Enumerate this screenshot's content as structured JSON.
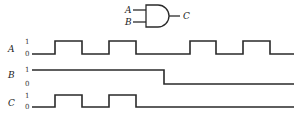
{
  "gate": {
    "type": "AND",
    "inputs": [
      "A",
      "B"
    ],
    "output": "C"
  },
  "signals": [
    {
      "name": "A",
      "high_label": "1",
      "low_label": "0",
      "levels": [
        0,
        1,
        0,
        1,
        0,
        0,
        1,
        0,
        1,
        0
      ]
    },
    {
      "name": "B",
      "high_label": "1",
      "low_label": "0",
      "levels": [
        1,
        1,
        1,
        1,
        1,
        0,
        0,
        0,
        0,
        0
      ]
    },
    {
      "name": "C",
      "high_label": "1",
      "low_label": "0",
      "levels": [
        0,
        1,
        0,
        1,
        0,
        0,
        0,
        0,
        0,
        0
      ]
    }
  ],
  "colors": {
    "line": "#2a2a2a",
    "background": "#ffffff"
  }
}
